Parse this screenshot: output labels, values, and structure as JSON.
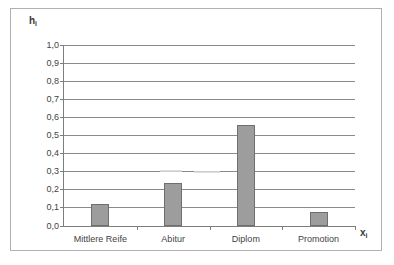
{
  "chart_data": {
    "type": "bar",
    "title": "",
    "subtitle": "",
    "xlabel": "x",
    "xlabel_sub": "i",
    "ylabel": "h",
    "ylabel_sub": "i",
    "categories": [
      "Mittlere Reife",
      "Abitur",
      "Diplom",
      "Promotion"
    ],
    "values": [
      0.12,
      0.24,
      0.56,
      0.08
    ],
    "series": [
      {
        "name": "h_i",
        "values": [
          0.12,
          0.24,
          0.56,
          0.08
        ]
      }
    ],
    "ylim": [
      0.0,
      1.0
    ],
    "ytick_step": 0.1,
    "ytick_labels": [
      "0,0",
      "0,1",
      "0,2",
      "0,3",
      "0,4",
      "0,5",
      "0,6",
      "0,7",
      "0,8",
      "0,9",
      "1,0"
    ],
    "ytick_values": [
      0.0,
      0.1,
      0.2,
      0.3,
      0.4,
      0.5,
      0.6,
      0.7,
      0.8,
      0.9,
      1.0
    ],
    "grid": true,
    "grid_axis": "y",
    "legend": false,
    "legend_position": "none",
    "decimal_separator": ",",
    "bar_color": "#9d9d9d",
    "bar_border_color": "#6f6f6f",
    "grid_color": "#8a8a8a",
    "axis_color": "#7d7d7d",
    "frame_color": "#b0b0b0",
    "background": "#ffffff",
    "text_color": "#3f3f3f"
  }
}
